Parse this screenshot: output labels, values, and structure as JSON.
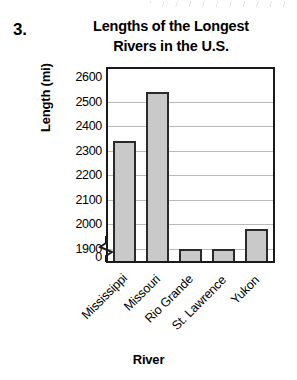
{
  "problem": {
    "number": "3.",
    "title_line1": "Lengths of the Longest",
    "title_line2": "Rivers in the U.S."
  },
  "chart_data": {
    "type": "bar",
    "title": "Lengths of the Longest Rivers in the U.S.",
    "xlabel": "River",
    "ylabel": "Length (mi)",
    "categories": [
      "Mississippi",
      "Missouri",
      "Rio Grande",
      "St. Lawrence",
      "Yukon"
    ],
    "values": [
      2340,
      2540,
      1900,
      1900,
      1980
    ],
    "yticks": [
      "2600",
      "2500",
      "2400",
      "2300",
      "2200",
      "2100",
      "2000",
      "1900",
      "0"
    ],
    "ylim": [
      1850,
      2600
    ],
    "axis_break": true,
    "axis_break_at": "1900",
    "grid": true,
    "legend": "none",
    "bar_fill_color": "#c9c9c9",
    "bar_border_color": "#2a2a2a",
    "gridline_color": "#b9b9b9",
    "axis_color": "#1a1a1a"
  }
}
